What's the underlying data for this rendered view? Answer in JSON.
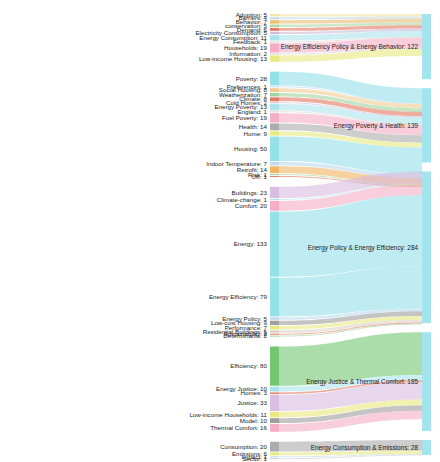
{
  "chart_data": {
    "type": "sankey",
    "title": "",
    "xlabel": "",
    "ylabel": "",
    "legend_position": "none",
    "grid": false,
    "nodes_left_label": "Keyword",
    "nodes_right_label": "Cluster",
    "sources": [
      {
        "label": "Adoption: 5",
        "name": "Adoption",
        "value": 5,
        "color": "#f2e3a0",
        "target": 0
      },
      {
        "label": "Barriers: 4",
        "name": "Barriers",
        "value": 4,
        "color": "#b9d7ea",
        "target": 0
      },
      {
        "label": "Behavior: 7",
        "name": "Behavior",
        "value": 7,
        "color": "#e8b96a",
        "target": 0
      },
      {
        "label": "conservation: 5",
        "name": "conservation",
        "value": 5,
        "color": "#a9d6a0",
        "target": 0
      },
      {
        "label": "Demand: 6",
        "name": "Demand",
        "value": 6,
        "color": "#e2715a",
        "target": 0
      },
      {
        "label": "Electricity Consumption: 5",
        "name": "Electricity Consumption",
        "value": 5,
        "color": "#cbb8d4",
        "target": 0
      },
      {
        "label": "Energy Consumption: 11",
        "name": "Energy Consumption",
        "value": 11,
        "color": "#a8e2ea",
        "target": 0
      },
      {
        "label": "Feedback: 1",
        "name": "Feedback",
        "value": 1,
        "color": "#d8cfc4",
        "target": 0
      },
      {
        "label": "Households: 19",
        "name": "Households",
        "value": 19,
        "color": "#f3aac4",
        "target": 0
      },
      {
        "label": "Information: 2",
        "name": "Information",
        "value": 2,
        "color": "#cbcbcb",
        "target": 0
      },
      {
        "label": "Low-income Housing: 13",
        "name": "Low-income Housing",
        "value": 13,
        "color": "#e7e87a",
        "target": 0
      },
      {
        "label": "Poverty: 28",
        "name": "Poverty",
        "value": 28,
        "color": "#8fdfe8",
        "target": 1
      },
      {
        "label": "Preferences: 1",
        "name": "Preferences",
        "value": 1,
        "color": "#b9d7ea",
        "target": 1
      },
      {
        "label": "Social Housing: 8",
        "name": "Social Housing",
        "value": 8,
        "color": "#f0c98a",
        "target": 1
      },
      {
        "label": "Weatherization: 7",
        "name": "Weatherization",
        "value": 7,
        "color": "#9bd39a",
        "target": 1
      },
      {
        "label": "Climate: 8",
        "name": "Climate",
        "value": 8,
        "color": "#e2715a",
        "target": 1
      },
      {
        "label": "Cold Homes: 2",
        "name": "Cold Homes",
        "value": 2,
        "color": "#cbb8d4",
        "target": 1
      },
      {
        "label": "Energy Poverty: 13",
        "name": "Energy Poverty",
        "value": 13,
        "color": "#a8e2ea",
        "target": 1
      },
      {
        "label": "England: 1",
        "name": "England",
        "value": 1,
        "color": "#d8cfc4",
        "target": 1
      },
      {
        "label": "Fuel Poverty: 19",
        "name": "Fuel Poverty",
        "value": 19,
        "color": "#f3aac4",
        "target": 1
      },
      {
        "label": "Health: 14",
        "name": "Health",
        "value": 14,
        "color": "#a8a8a8",
        "target": 1
      },
      {
        "label": "Home: 9",
        "name": "Home",
        "value": 9,
        "color": "#e7e87a",
        "target": 1
      },
      {
        "label": "Housing: 50",
        "name": "Housing",
        "value": 50,
        "color": "#8fdfe8",
        "target": 1
      },
      {
        "label": "Indoor Temperature: 7",
        "name": "Indoor Temperature",
        "value": 7,
        "color": "#b9d7ea",
        "target": 1
      },
      {
        "label": "Retrofit: 14",
        "name": "Retrofit",
        "value": 14,
        "color": "#f0b259",
        "target": 1
      },
      {
        "label": "Risk: 1",
        "name": "Risk",
        "value": 1,
        "color": "#9bd39a",
        "target": 1
      },
      {
        "label": "UK: 1",
        "name": "UK",
        "value": 1,
        "color": "#e2715a",
        "target": 1
      },
      {
        "label": "Buildings: 23",
        "name": "Buildings",
        "value": 23,
        "color": "#d8b9e0",
        "target": 2
      },
      {
        "label": "Climate-change: 1",
        "name": "Climate-change",
        "value": 1,
        "color": "#a8e2ea",
        "target": 2
      },
      {
        "label": "Comfort: 20",
        "name": "Comfort",
        "value": 20,
        "color": "#f3aac4",
        "target": 2
      },
      {
        "label": "Energy: 133",
        "name": "Energy",
        "value": 133,
        "color": "#8fdfe8",
        "target": 2
      },
      {
        "label": "Energy Efficiency: 79",
        "name": "Energy Efficiency",
        "value": 79,
        "color": "#8fdfe8",
        "target": 2
      },
      {
        "label": "Energy Policy: 5",
        "name": "Energy Policy",
        "value": 5,
        "color": "#b9d7ea",
        "target": 2
      },
      {
        "label": "Low-cost Housing: 9",
        "name": "Low-cost Housing",
        "value": 9,
        "color": "#9a9a9a",
        "target": 2
      },
      {
        "label": "Performance: 7",
        "name": "Performance",
        "value": 7,
        "color": "#e7e87a",
        "target": 2
      },
      {
        "label": "Residential Buildings: 5",
        "name": "Residential Buildings",
        "value": 5,
        "color": "#d8cfc4",
        "target": 2
      },
      {
        "label": "Sustainability: 2",
        "name": "Sustainability",
        "value": 2,
        "color": "#e2715a",
        "target": 2
      },
      {
        "label": "Determinants: 2",
        "name": "Determinants",
        "value": 2,
        "color": "#9bd39a",
        "target": 2
      },
      {
        "label": "Efficiency: 80",
        "name": "Efficiency",
        "value": 80,
        "color": "#6cc46c",
        "target": 3
      },
      {
        "label": "Energy Justice: 10",
        "name": "Energy Justice",
        "value": 10,
        "color": "#a8e2ea",
        "target": 3
      },
      {
        "label": "Homes: 3",
        "name": "Homes",
        "value": 3,
        "color": "#e2715a",
        "target": 3
      },
      {
        "label": "Justice: 33",
        "name": "Justice",
        "value": 33,
        "color": "#d8b9e0",
        "target": 3
      },
      {
        "label": "Low-income Households: 11",
        "name": "Low-income Households",
        "value": 11,
        "color": "#e7e87a",
        "target": 3
      },
      {
        "label": "Model: 10",
        "name": "Model",
        "value": 10,
        "color": "#9a9a9a",
        "target": 3
      },
      {
        "label": "Thermal Comfort: 16",
        "name": "Thermal Comfort",
        "value": 16,
        "color": "#f3aac4",
        "target": 3
      },
      {
        "label": "Consumption: 20",
        "name": "Consumption",
        "value": 20,
        "color": "#a8a8a8",
        "target": 4
      },
      {
        "label": "Emissions: 6",
        "name": "Emissions",
        "value": 6,
        "color": "#e7e87a",
        "target": 4
      },
      {
        "label": "Impact: 1",
        "name": "Impact",
        "value": 1,
        "color": "#b9d7ea",
        "target": 4
      },
      {
        "label": "Sector: 1",
        "name": "Sector",
        "value": 1,
        "color": "#cbcbcb",
        "target": 4
      }
    ],
    "targets": [
      {
        "label": "Energy Efficiency Policy & Energy Behavior: 122",
        "name": "Energy Efficiency Policy & Energy Behavior",
        "value": 122,
        "color": "#9fe3ee"
      },
      {
        "label": "Energy Poverty & Health: 139",
        "name": "Energy Poverty & Health",
        "value": 139,
        "color": "#9fe3ee"
      },
      {
        "label": "Energy Policy & Energy Efficiency: 284",
        "name": "Energy Policy & Energy Efficiency",
        "value": 284,
        "color": "#9fe3ee"
      },
      {
        "label": "Energy Justice & Thermal Comfort: 185",
        "name": "Energy Justice & Thermal Comfort",
        "value": 185,
        "color": "#9fe3ee"
      },
      {
        "label": "Energy Consumption & Emissions: 28",
        "name": "Energy Consumption & Emissions",
        "value": 28,
        "color": "#9fe3ee"
      }
    ]
  }
}
